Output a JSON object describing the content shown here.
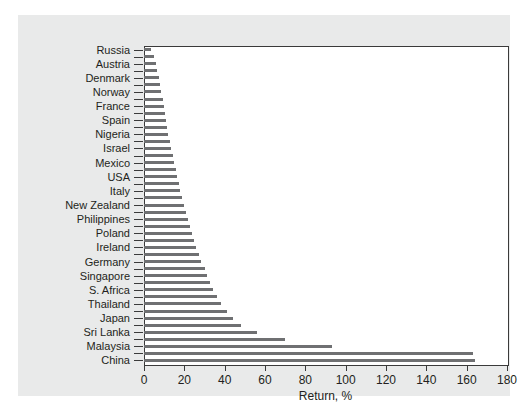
{
  "chart_data": {
    "type": "bar",
    "orientation": "horizontal",
    "title": "",
    "xlabel": "Return, %",
    "ylabel": "",
    "xlim": [
      0,
      180
    ],
    "xticks": [
      0,
      20,
      40,
      60,
      80,
      100,
      120,
      140,
      160,
      180
    ],
    "xticklabels": [
      "0",
      "20",
      "40",
      "60",
      "80",
      "100",
      "120",
      "140",
      "160",
      "180"
    ],
    "grid": false,
    "legend": null,
    "bar_color": "#6f7072",
    "plot_background": "#ffffff",
    "panel_background": "#e9eaea",
    "axis_color": "#3a3a3a",
    "text_color": "#231f20",
    "tick_label_interval": 2,
    "categories": [
      "Russia",
      "",
      "Austria",
      "",
      "Denmark",
      "",
      "Norway",
      "",
      "France",
      "",
      "Spain",
      "",
      "Nigeria",
      "",
      "Israel",
      "",
      "Mexico",
      "",
      "USA",
      "",
      "Italy",
      "",
      "New Zealand",
      "",
      "Philippines",
      "",
      "Poland",
      "",
      "Ireland",
      "",
      "Germany",
      "",
      "Singapore",
      "",
      "S. Africa",
      "",
      "Thailand",
      "",
      "Japan",
      "",
      "Sri Lanka",
      "",
      "Malaysia",
      "",
      "China"
    ],
    "values": [
      3.5,
      5.0,
      6.0,
      6.5,
      7.5,
      8.0,
      8.5,
      9.5,
      10.0,
      10.5,
      11.0,
      11.5,
      12.0,
      13.0,
      13.5,
      14.5,
      15.0,
      16.0,
      16.5,
      17.5,
      18.0,
      19.0,
      20.0,
      21.0,
      22.0,
      23.0,
      24.0,
      25.0,
      26.0,
      27.5,
      28.5,
      30.0,
      31.0,
      32.5,
      34.0,
      36.0,
      38.0,
      41.0,
      44.0,
      48.0,
      56.0,
      70.0,
      93.0,
      163.0,
      164.0
    ],
    "tick_labels_visible": [
      "Russia",
      "Austria",
      "Denmark",
      "Norway",
      "France",
      "Spain",
      "Nigeria",
      "Israel",
      "Mexico",
      "USA",
      "Italy",
      "New Zealand",
      "Philippines",
      "Poland",
      "Ireland",
      "Germany",
      "Singapore",
      "S. Africa",
      "Thailand",
      "Japan",
      "Sri Lanka",
      "Malaysia",
      "China"
    ]
  }
}
